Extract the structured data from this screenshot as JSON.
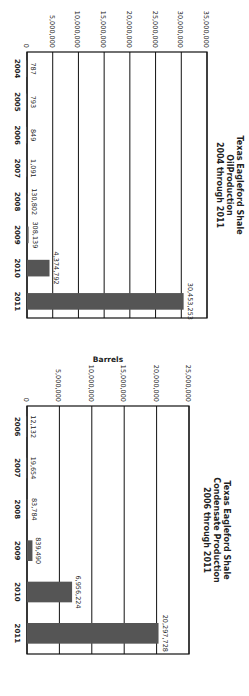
{
  "chart_data": [
    {
      "type": "bar",
      "title": [
        "Texas Eagleford Shale",
        "OilProduction",
        "2004 through 2011"
      ],
      "xlabel": "",
      "ylabel": "",
      "categories": [
        "2004",
        "2005",
        "2006",
        "2007",
        "2008",
        "2009",
        "2010",
        "2011"
      ],
      "values": [
        787,
        793,
        849,
        1091,
        130802,
        308139,
        4374792,
        30453253
      ],
      "value_labels": [
        "787",
        "793",
        "849",
        "1,091",
        "130,802",
        "308,139",
        "4,374,792",
        "30,453,253"
      ],
      "ylim": [
        0,
        35000000
      ],
      "yticks": [
        0,
        5000000,
        10000000,
        15000000,
        20000000,
        25000000,
        30000000,
        35000000
      ],
      "ytick_labels": [
        "0",
        "5,000,000",
        "10,000,000",
        "15,000,000",
        "20,000,000",
        "25,000,000",
        "30,000,000",
        "35,000,000"
      ],
      "grid": true,
      "bar_color": "#555555"
    },
    {
      "type": "bar",
      "title": [
        "Texas Eagleford Shale",
        "Condensate Production",
        "2006 through 2011"
      ],
      "xlabel": "",
      "ylabel": "Barrels",
      "categories": [
        "2006",
        "2007",
        "2008",
        "2009",
        "2010",
        "2011"
      ],
      "values": [
        12132,
        19654,
        83784,
        839490,
        6956224,
        20297728
      ],
      "value_labels": [
        "12,132",
        "19,654",
        "83,784",
        "839,490",
        "6,956,224",
        "20,297,728"
      ],
      "ylim": [
        0,
        25000000
      ],
      "yticks": [
        0,
        5000000,
        10000000,
        15000000,
        20000000,
        25000000
      ],
      "ytick_labels": [
        "0",
        "5,000,000",
        "10,000,000",
        "15,000,000",
        "20,000,000",
        "25,000,000"
      ],
      "grid": true,
      "bar_color": "#555555"
    }
  ]
}
